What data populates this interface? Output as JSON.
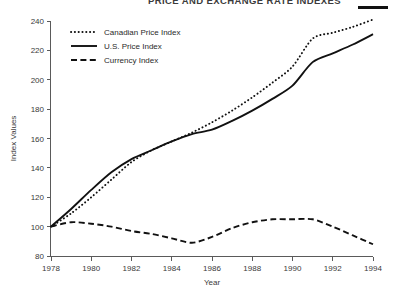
{
  "figure": {
    "title_partial": "PRICE AND EXCHANGE RATE INDEXES",
    "title_rule_color": "#111111",
    "background": "#ffffff",
    "ink_color": "#111111",
    "axis_color": "#5a5a5a"
  },
  "legend": {
    "position": "upper-left-inside",
    "items": [
      {
        "label": "Canadian Price Index",
        "style": "dotted"
      },
      {
        "label": "U.S. Price Index",
        "style": "solid"
      },
      {
        "label": "Currency Index",
        "style": "dashed"
      }
    ]
  },
  "chart_data": {
    "type": "line",
    "title": "PRICE AND EXCHANGE RATE INDEXES",
    "xlabel": "Year",
    "ylabel": "Index Values",
    "xlim": [
      1978,
      1994
    ],
    "ylim": [
      80,
      240
    ],
    "xticks": [
      1978,
      1980,
      1982,
      1984,
      1986,
      1988,
      1990,
      1992,
      1994
    ],
    "xtick_labels": [
      "1978",
      "1980",
      "1982",
      "1984",
      "1986",
      "1988",
      "1990",
      "1992",
      "1994"
    ],
    "yticks": [
      80,
      100,
      120,
      140,
      160,
      180,
      200,
      220,
      240
    ],
    "ytick_labels": [
      "80",
      "100",
      "120",
      "140",
      "160",
      "180",
      "200",
      "220",
      "240"
    ],
    "grid": false,
    "legend_position": "upper left",
    "x": [
      1978,
      1979,
      1980,
      1981,
      1982,
      1983,
      1984,
      1985,
      1986,
      1987,
      1988,
      1989,
      1990,
      1991,
      1992,
      1993,
      1994
    ],
    "series": [
      {
        "name": "Canadian Price Index",
        "style": "dotted",
        "values": [
          100,
          109,
          120,
          132,
          144,
          152,
          158,
          164,
          171,
          179,
          188,
          198,
          209,
          228,
          232,
          236,
          241
        ]
      },
      {
        "name": "U.S. Price Index",
        "style": "solid",
        "values": [
          100,
          112,
          125,
          137,
          146,
          152,
          158,
          163,
          166,
          172,
          179,
          187,
          196,
          212,
          218,
          224,
          231
        ]
      },
      {
        "name": "Currency Index",
        "style": "dashed",
        "values": [
          100,
          103,
          102,
          100,
          97,
          95,
          92,
          89,
          93,
          99,
          103,
          105,
          105,
          105,
          100,
          94,
          88
        ]
      }
    ]
  }
}
